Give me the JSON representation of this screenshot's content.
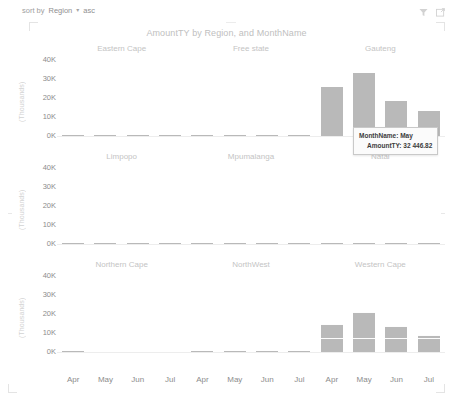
{
  "header": {
    "sort_prefix": "sort by",
    "sort_field": "Region",
    "sort_caret": "▾",
    "sort_direction": "asc",
    "filter_icon": "filter-icon",
    "focus_icon": "focus-mode-icon"
  },
  "chart_title": "AmountTY by Region, and MonthName",
  "tooltip": {
    "line1_label": "MonthName:",
    "line1_value": "May",
    "line2_label": "AmountTY:",
    "line2_value": "32 446.82"
  },
  "axis": {
    "y_unit_label": "(Thousands)",
    "y_ticks": [
      "40K",
      "30K",
      "20K",
      "10K",
      "0K"
    ],
    "x_categories": [
      "Apr",
      "May",
      "Jun",
      "Jul"
    ]
  },
  "colors": {
    "bar": "#b9b9b9",
    "axis": "#ededed",
    "facet_title": "#c4c4c4",
    "tick_text": "#8c8c8c",
    "title": "#c0c0c0"
  },
  "chart_data": {
    "type": "bar",
    "title": "AmountTY by Region, and MonthName",
    "xlabel": "MonthName",
    "ylabel": "(Thousands)",
    "ylim": [
      0,
      40000
    ],
    "yticks": [
      0,
      10000,
      20000,
      30000,
      40000
    ],
    "grid": false,
    "legend": "none",
    "facet_layout": [
      3,
      3
    ],
    "categories": [
      "Apr",
      "May",
      "Jun",
      "Jul"
    ],
    "series": [
      {
        "name": "Eastern Cape",
        "values": [
          90,
          70,
          60,
          80
        ]
      },
      {
        "name": "Free state",
        "values": [
          60,
          50,
          40,
          45
        ]
      },
      {
        "name": "Gauteng",
        "values": [
          25000,
          32446.82,
          18000,
          12800
        ]
      },
      {
        "name": "Limpopo",
        "values": [
          70,
          60,
          55,
          65
        ]
      },
      {
        "name": "Mpumalanga",
        "values": [
          60,
          55,
          50,
          45
        ]
      },
      {
        "name": "Natal",
        "values": [
          420,
          120,
          110,
          100
        ]
      },
      {
        "name": "Northern Cape",
        "values": [
          300,
          0,
          0,
          0
        ]
      },
      {
        "name": "NorthWest",
        "values": [
          55,
          50,
          45,
          60
        ]
      },
      {
        "name": "Western Cape",
        "values": [
          14200,
          20600,
          13500,
          8700
        ]
      }
    ]
  },
  "facets": [
    [
      {
        "label": "Eastern Cape",
        "values": [
          90,
          70,
          60,
          80
        ]
      },
      {
        "label": "Free state",
        "values": [
          60,
          50,
          40,
          45
        ]
      },
      {
        "label": "Gauteng",
        "values": [
          25000,
          32446.82,
          18000,
          12800
        ]
      }
    ],
    [
      {
        "label": "Limpopo",
        "values": [
          70,
          60,
          55,
          65
        ]
      },
      {
        "label": "Mpumalanga",
        "values": [
          60,
          55,
          50,
          45
        ]
      },
      {
        "label": "Natal",
        "values": [
          420,
          120,
          110,
          100
        ]
      }
    ],
    [
      {
        "label": "Northern Cape",
        "values": [
          300,
          0,
          0,
          0
        ]
      },
      {
        "label": "NorthWest",
        "values": [
          55,
          50,
          45,
          60
        ]
      },
      {
        "label": "Western Cape",
        "values": [
          14200,
          20600,
          13500,
          8700
        ]
      }
    ]
  ]
}
